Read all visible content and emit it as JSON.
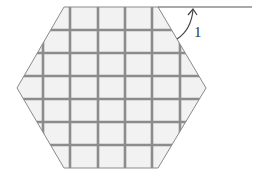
{
  "diagram": {
    "type": "geometry",
    "shape": "regular-hexagon-with-grid",
    "hexagon": {
      "vertices": [
        [
          64,
          7
        ],
        [
          158,
          7
        ],
        [
          206,
          88
        ],
        [
          158,
          168
        ],
        [
          64,
          168
        ],
        [
          17,
          88
        ]
      ],
      "fill": "#f2f2f2",
      "stroke": "#8a8a8a"
    },
    "grid": {
      "vertical_x": [
        43,
        70,
        98,
        125,
        152,
        180
      ],
      "horizontal_y": [
        30,
        53,
        76,
        99,
        122,
        145
      ],
      "stroke": "#8c8c8c"
    },
    "extension_line": {
      "from": [
        158,
        7
      ],
      "to": [
        252,
        7
      ],
      "stroke": "#555555"
    },
    "angle_marker": {
      "label": "1",
      "arc_from": [
        177,
        39
      ],
      "arc_to": [
        193,
        9
      ],
      "label_pos": [
        195,
        36
      ]
    }
  }
}
